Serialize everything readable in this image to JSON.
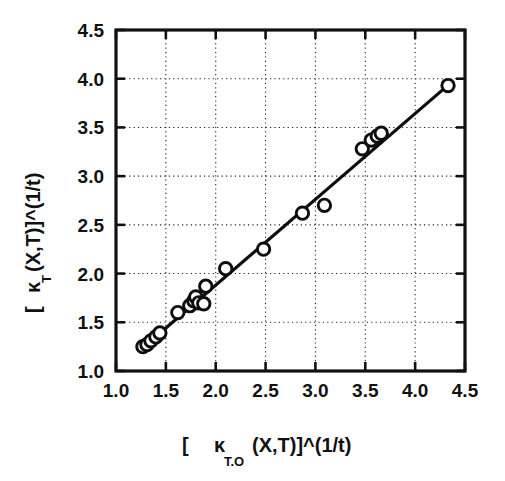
{
  "chart_data": {
    "type": "scatter",
    "title": "",
    "subtitle": "",
    "xlabel": "[  κ      (X,T)]^(1/t)",
    "xlabel_main_pre": "[",
    "xlabel_kappa": "κ",
    "xlabel_kappa_subscript": "T.O",
    "xlabel_main_post": "(X,T)]^(1/t)",
    "ylabel": "[ κ  (X,T)]^(1/t)",
    "ylabel_main_pre": "[",
    "ylabel_kappa": "κ",
    "ylabel_kappa_subscript": "T",
    "ylabel_main_post": "(X,T)]^(1/t)",
    "xlim": [
      1.0,
      4.5
    ],
    "ylim": [
      1.0,
      4.5
    ],
    "xticks": [
      1.0,
      1.5,
      2.0,
      2.5,
      3.0,
      3.5,
      4.0,
      4.5
    ],
    "yticks": [
      1.0,
      1.5,
      2.0,
      2.5,
      3.0,
      3.5,
      4.0,
      4.5
    ],
    "xtick_labels": [
      "1.0",
      "1.5",
      "2.0",
      "2.5",
      "3.0",
      "3.5",
      "4.0",
      "4.5"
    ],
    "ytick_labels": [
      "1.0",
      "1.5",
      "2.0",
      "2.5",
      "3.0",
      "3.5",
      "4.0",
      "4.5"
    ],
    "grid": true,
    "grid_style": "dotted",
    "legend": null,
    "legend_position": "none",
    "marker_style": "open-circle",
    "marker_color": "#ffffff",
    "marker_edge_color": "#0d0d0d",
    "line_color": "#0d0d0d",
    "points": [
      {
        "x": 1.27,
        "y": 1.25
      },
      {
        "x": 1.31,
        "y": 1.27
      },
      {
        "x": 1.35,
        "y": 1.31
      },
      {
        "x": 1.4,
        "y": 1.35
      },
      {
        "x": 1.44,
        "y": 1.39
      },
      {
        "x": 1.62,
        "y": 1.6
      },
      {
        "x": 1.74,
        "y": 1.67
      },
      {
        "x": 1.78,
        "y": 1.72
      },
      {
        "x": 1.8,
        "y": 1.76
      },
      {
        "x": 1.83,
        "y": 1.7
      },
      {
        "x": 1.88,
        "y": 1.69
      },
      {
        "x": 1.9,
        "y": 1.87
      },
      {
        "x": 2.1,
        "y": 2.05
      },
      {
        "x": 2.48,
        "y": 2.25
      },
      {
        "x": 2.87,
        "y": 2.62
      },
      {
        "x": 3.09,
        "y": 2.7
      },
      {
        "x": 3.47,
        "y": 3.28
      },
      {
        "x": 3.56,
        "y": 3.37
      },
      {
        "x": 3.62,
        "y": 3.41
      },
      {
        "x": 3.66,
        "y": 3.44
      },
      {
        "x": 4.33,
        "y": 3.93
      }
    ],
    "fit_line": {
      "x_start": 1.25,
      "y_start": 1.22,
      "x_end": 4.36,
      "y_end": 3.96,
      "description": "linear best-fit line through data"
    }
  },
  "colors": {
    "background": "#ffffff",
    "foreground": "#111111",
    "grid": "#222222",
    "marker_fill": "#ffffff",
    "marker_edge": "#0d0d0d"
  }
}
